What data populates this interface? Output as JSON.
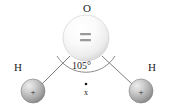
{
  "figure": {
    "name": "water-molecule-diagram",
    "background_color": "#ffffff",
    "width": 171,
    "height": 109
  },
  "atoms": {
    "oxygen": {
      "label": "O",
      "label_x": 83,
      "label_y": 3,
      "center_x": 86,
      "center_y": 38,
      "radius": 23,
      "fill_light": "#ffffff",
      "fill_mid": "#f2f2f2",
      "fill_dark": "#d8d8d8",
      "edge_color": "#c9c9c9",
      "lone_pair_marks": 2,
      "lone_pair_color": "#9a9a9a"
    },
    "hydrogen_left": {
      "label": "H",
      "label_x": 14,
      "label_y": 62,
      "center_x": 33,
      "center_y": 91,
      "radius": 12,
      "charge": "+",
      "fill_light": "#e8e8e8",
      "fill_mid": "#bdbdbd",
      "fill_dark": "#8c8c8c",
      "edge_color": "#808080"
    },
    "hydrogen_right": {
      "label": "H",
      "label_x": 148,
      "label_y": 62,
      "center_x": 141,
      "center_y": 91,
      "radius": 12,
      "charge": "+",
      "fill_light": "#e8e8e8",
      "fill_mid": "#bdbdbd",
      "fill_dark": "#8c8c8c",
      "edge_color": "#808080"
    }
  },
  "bonds": {
    "color": "#6e6e6e",
    "width": 0.9,
    "left": {
      "x1": 70,
      "y1": 56,
      "x2": 42,
      "y2": 84
    },
    "right": {
      "x1": 102,
      "y1": 56,
      "x2": 132,
      "y2": 84
    }
  },
  "angle": {
    "value_label": "105°",
    "label_x": 72,
    "label_y": 61,
    "arc_color": "#6e6e6e",
    "arc_width": 0.8,
    "arc_path": "M 57 56 A 34 34 0 0 0 115 56"
  },
  "dipole_marker": {
    "label": "x",
    "label_x": 84,
    "label_y": 89,
    "dot_x": 86,
    "dot_y": 84,
    "dot_radius": 1.3,
    "color": "#1b1b1b"
  }
}
